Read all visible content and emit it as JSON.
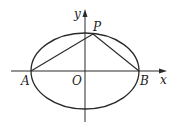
{
  "diagram": {
    "type": "ellipse-coordinate-figure",
    "colors": {
      "stroke": "#2a2a2a",
      "background": "#ffffff",
      "text": "#222222"
    },
    "axes": {
      "x_label": "x",
      "y_label": "y",
      "origin_label": "O"
    },
    "ellipse": {
      "center": [
        85,
        71
      ],
      "rx": 54,
      "ry": 38
    },
    "points": {
      "A": {
        "label": "A",
        "description": "left vertex of ellipse on x-axis"
      },
      "B": {
        "label": "B",
        "description": "right vertex of ellipse on x-axis"
      },
      "P": {
        "label": "P",
        "description": "point on ellipse near top, right of y-axis"
      }
    },
    "segments": [
      "PA",
      "PB"
    ]
  }
}
